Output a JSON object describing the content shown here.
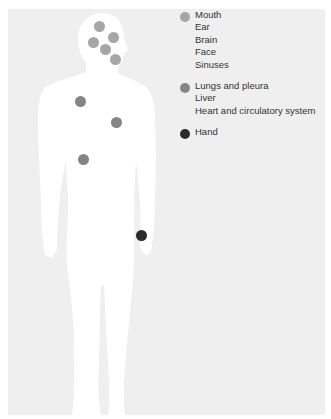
{
  "colors": {
    "background": "#efefef",
    "silhouette": "#ffffff",
    "light_group": "#a6a6a6",
    "mid_group": "#858585",
    "dark_group": "#2a2a2a"
  },
  "legend": {
    "groups": [
      {
        "color": "#a6a6a6",
        "items": [
          "Mouth",
          "Ear",
          "Brain",
          "Face",
          "Sinuses"
        ]
      },
      {
        "color": "#858585",
        "items": [
          "Lungs and pleura",
          "Liver",
          "Heart and circulatory system"
        ]
      },
      {
        "color": "#2a2a2a",
        "items": [
          "Hand"
        ]
      }
    ]
  },
  "markers": [
    {
      "group": "light",
      "x": 99,
      "y": 26
    },
    {
      "group": "light",
      "x": 113,
      "y": 37
    },
    {
      "group": "light",
      "x": 93,
      "y": 42
    },
    {
      "group": "light",
      "x": 105,
      "y": 49
    },
    {
      "group": "light",
      "x": 115,
      "y": 59
    },
    {
      "group": "mid",
      "x": 80,
      "y": 101
    },
    {
      "group": "mid",
      "x": 116,
      "y": 122
    },
    {
      "group": "mid",
      "x": 83,
      "y": 159
    },
    {
      "group": "dark",
      "x": 141,
      "y": 235
    }
  ]
}
